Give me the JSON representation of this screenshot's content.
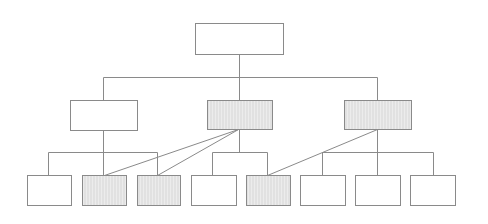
{
  "diagram": {
    "type": "hierarchy-tree",
    "colors": {
      "stroke": "#8a8a8a",
      "fill_plain": "#ffffff",
      "fill_shaded": "#ececec",
      "hatch": "#d6d6d6"
    },
    "nodes": [
      {
        "id": "root",
        "level": 0,
        "x": 195,
        "y": 23,
        "w": 88,
        "h": 31,
        "shaded": false
      },
      {
        "id": "m1",
        "level": 1,
        "x": 70,
        "y": 100,
        "w": 67,
        "h": 30,
        "shaded": false
      },
      {
        "id": "m2",
        "level": 1,
        "x": 207,
        "y": 100,
        "w": 65,
        "h": 29,
        "shaded": true
      },
      {
        "id": "m3",
        "level": 1,
        "x": 344,
        "y": 100,
        "w": 67,
        "h": 29,
        "shaded": true
      },
      {
        "id": "b1",
        "level": 2,
        "x": 27,
        "y": 175,
        "w": 44,
        "h": 30,
        "shaded": false
      },
      {
        "id": "b2",
        "level": 2,
        "x": 82,
        "y": 175,
        "w": 44,
        "h": 30,
        "shaded": true
      },
      {
        "id": "b3",
        "level": 2,
        "x": 137,
        "y": 175,
        "w": 43,
        "h": 30,
        "shaded": true
      },
      {
        "id": "b4",
        "level": 2,
        "x": 191,
        "y": 175,
        "w": 45,
        "h": 30,
        "shaded": false
      },
      {
        "id": "b5",
        "level": 2,
        "x": 246,
        "y": 175,
        "w": 44,
        "h": 30,
        "shaded": true
      },
      {
        "id": "b6",
        "level": 2,
        "x": 300,
        "y": 175,
        "w": 45,
        "h": 30,
        "shaded": false
      },
      {
        "id": "b7",
        "level": 2,
        "x": 355,
        "y": 175,
        "w": 45,
        "h": 30,
        "shaded": false
      },
      {
        "id": "b8",
        "level": 2,
        "x": 410,
        "y": 175,
        "w": 45,
        "h": 30,
        "shaded": false
      }
    ],
    "lines": [
      [
        239,
        54,
        239,
        77
      ],
      [
        103,
        77,
        377,
        77
      ],
      [
        103,
        77,
        103,
        100
      ],
      [
        239,
        77,
        239,
        100
      ],
      [
        377,
        77,
        377,
        100
      ],
      [
        103,
        130,
        103,
        175
      ],
      [
        48,
        152,
        157,
        152
      ],
      [
        48,
        152,
        48,
        175
      ],
      [
        157,
        152,
        157,
        175
      ],
      [
        239,
        129,
        239,
        152
      ],
      [
        212,
        152,
        267,
        152
      ],
      [
        212,
        152,
        212,
        175
      ],
      [
        267,
        152,
        267,
        175
      ],
      [
        377,
        129,
        377,
        175
      ],
      [
        322,
        152,
        433,
        152
      ],
      [
        322,
        152,
        322,
        175
      ],
      [
        433,
        152,
        433,
        175
      ],
      [
        238,
        129,
        104,
        175
      ],
      [
        238,
        129,
        157,
        175
      ],
      [
        377,
        129,
        267,
        175
      ]
    ]
  }
}
